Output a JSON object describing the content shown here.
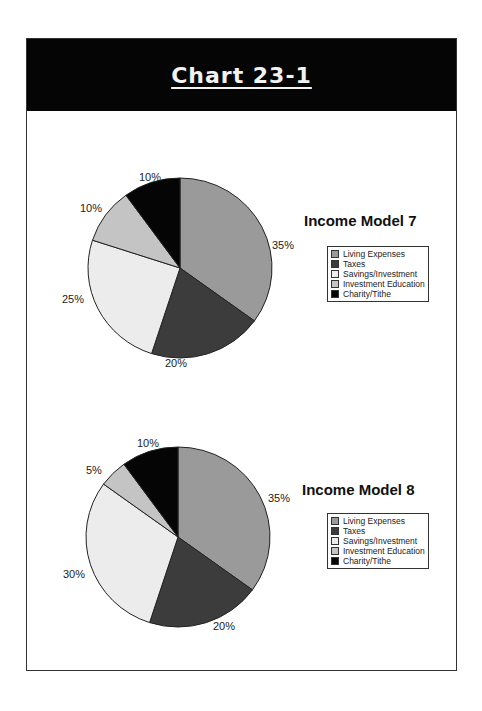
{
  "header": {
    "title": "Chart 23-1"
  },
  "colors": {
    "living": "#9a9a9a",
    "taxes": "#3c3c3c",
    "savings": "#ececec",
    "education": "#c4c4c4",
    "charity": "#050505"
  },
  "chart_data": [
    {
      "type": "pie",
      "title": "Income Model 7",
      "categories": [
        "Living Expenses",
        "Taxes",
        "Savings/Investment",
        "Investment Education",
        "Charity/Tithe"
      ],
      "values": [
        35,
        20,
        25,
        10,
        10
      ],
      "labels": [
        "35%",
        "20%",
        "25%",
        "10%",
        "10%"
      ],
      "legend_position": "right"
    },
    {
      "type": "pie",
      "title": "Income Model 8",
      "categories": [
        "Living Expenses",
        "Taxes",
        "Savings/Investment",
        "Investment Education",
        "Charity/Tithe"
      ],
      "values": [
        35,
        20,
        30,
        5,
        10
      ],
      "labels": [
        "35%",
        "20%",
        "30%",
        "5%",
        "10%"
      ],
      "legend_position": "right"
    }
  ],
  "legend": [
    "Living Expenses",
    "Taxes",
    "Savings/Investment",
    "Investment Education",
    "Charity/Tithe"
  ]
}
